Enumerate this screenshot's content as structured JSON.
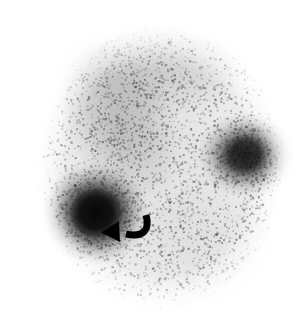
{
  "image": {
    "modality": "scintigraphy",
    "width": 304,
    "height": 321,
    "background_color": "#ffffff",
    "body_fill_color": "#f2f2f2",
    "speckle_color": "#2b2b2b",
    "hotspot_color": "#0d0d0d",
    "annotation_color": "#000000"
  },
  "body_field": {
    "name": "body-silhouette",
    "center_x": 160,
    "center_y": 168,
    "radius_x": 126,
    "radius_y": 148,
    "edge_softness": 22
  },
  "regions": [
    {
      "name": "diffuse-uptake-band",
      "label": "diffuse tracer uptake band",
      "center_x": 120,
      "center_y": 120,
      "radius_x": 62,
      "radius_y": 96,
      "rotation_deg": -24,
      "intensity": 0.52
    },
    {
      "name": "upper-field-uptake",
      "label": "upper field background uptake",
      "center_x": 158,
      "center_y": 72,
      "radius_x": 96,
      "radius_y": 52,
      "rotation_deg": 0,
      "intensity": 0.34
    },
    {
      "name": "lower-right-cold-area",
      "label": "lower right reduced uptake",
      "center_x": 200,
      "center_y": 245,
      "radius_x": 82,
      "radius_y": 70,
      "rotation_deg": 0,
      "intensity": 0.1
    }
  ],
  "hotspots": [
    {
      "name": "primary-focal-hotspot",
      "label": "intense focal uptake (arrow)",
      "center_x": 96,
      "center_y": 213,
      "radius_x": 30,
      "radius_y": 29,
      "intensity": 1.0
    },
    {
      "name": "secondary-focal-hotspot",
      "label": "second focal uptake",
      "center_x": 245,
      "center_y": 155,
      "radius_x": 27,
      "radius_y": 24,
      "intensity": 0.72
    }
  ],
  "annotations": [
    {
      "name": "curved-arrow-marker",
      "icon": "curved-arrow-left-icon",
      "label": "curved arrow pointing to primary focal hotspot",
      "tip_x": 113,
      "tip_y": 233,
      "tail_x": 146,
      "tail_y": 216,
      "stroke_width": 7,
      "color": "#000000"
    }
  ],
  "noise": {
    "name": "gamma-camera-speckle",
    "grain_count": 21000,
    "grain_size_min": 1,
    "grain_size_max": 2.3,
    "seed": 20607
  },
  "caption": {
    "alt_text": "Nuclear medicine scintigram showing diffuse tracer uptake with two focal hot spots; a curved arrow marks the intense lower-left focus."
  }
}
